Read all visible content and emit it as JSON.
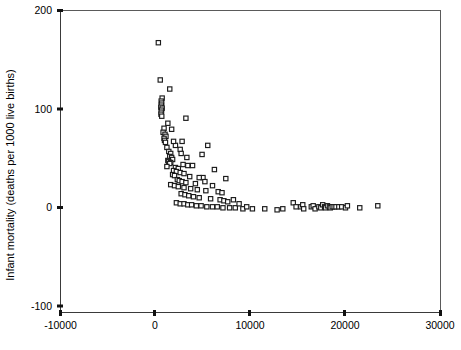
{
  "chart_data": {
    "type": "scatter",
    "title": "",
    "xlabel": "",
    "ylabel": "Infant mortality (deaths per 1000 live births)",
    "xlim": [
      -10000,
      30000
    ],
    "ylim": [
      -100,
      200
    ],
    "xticks": [
      -10000,
      0,
      10000,
      20000,
      30000
    ],
    "yticks": [
      -100,
      0,
      100,
      200
    ],
    "xtick_labels": [
      "-10000",
      "0",
      "10000",
      "20000",
      "30000"
    ],
    "ytick_labels": [
      "-100",
      "0",
      "100",
      "200"
    ],
    "grid": false,
    "legend": null,
    "marker": "open-square",
    "marker_color": "#1b1b1b",
    "series": [
      {
        "name": "Countries",
        "points": [
          [
            300,
            168
          ],
          [
            500,
            131
          ],
          [
            1500,
            122
          ],
          [
            700,
            113
          ],
          [
            600,
            110
          ],
          [
            650,
            108
          ],
          [
            620,
            106
          ],
          [
            560,
            104
          ],
          [
            700,
            103
          ],
          [
            640,
            101
          ],
          [
            600,
            99
          ],
          [
            580,
            97
          ],
          [
            660,
            95
          ],
          [
            3200,
            93
          ],
          [
            900,
            83
          ],
          [
            800,
            79
          ],
          [
            1000,
            77
          ],
          [
            1100,
            75
          ],
          [
            900,
            73
          ],
          [
            950,
            71
          ],
          [
            1050,
            69
          ],
          [
            5500,
            66
          ],
          [
            1200,
            64
          ],
          [
            2600,
            62
          ],
          [
            1400,
            60
          ],
          [
            1600,
            58
          ],
          [
            4900,
            57
          ],
          [
            1500,
            55
          ],
          [
            1700,
            54
          ],
          [
            1800,
            52
          ],
          [
            1300,
            51
          ],
          [
            1400,
            50
          ],
          [
            1600,
            49
          ],
          [
            1500,
            48
          ],
          [
            2900,
            47
          ],
          [
            3400,
            46
          ],
          [
            1200,
            45
          ],
          [
            2100,
            44
          ],
          [
            2400,
            43
          ],
          [
            6200,
            42
          ],
          [
            1900,
            41
          ],
          [
            2200,
            40
          ],
          [
            2600,
            39
          ],
          [
            3000,
            38
          ],
          [
            1800,
            37
          ],
          [
            2000,
            36
          ],
          [
            3600,
            35
          ],
          [
            5000,
            34
          ],
          [
            7400,
            33
          ],
          [
            2300,
            32
          ],
          [
            2500,
            31
          ],
          [
            2800,
            30
          ],
          [
            3200,
            29
          ],
          [
            4200,
            28
          ],
          [
            1600,
            27
          ],
          [
            2000,
            26
          ],
          [
            2400,
            25
          ],
          [
            3000,
            24
          ],
          [
            3700,
            23
          ],
          [
            4400,
            22
          ],
          [
            5300,
            21
          ],
          [
            6600,
            20
          ],
          [
            7000,
            19
          ],
          [
            2700,
            18
          ],
          [
            3100,
            17
          ],
          [
            3500,
            16
          ],
          [
            4000,
            15
          ],
          [
            4600,
            14
          ],
          [
            5800,
            13
          ],
          [
            6800,
            12
          ],
          [
            7200,
            11
          ],
          [
            7600,
            10
          ],
          [
            2200,
            9
          ],
          [
            2600,
            8
          ],
          [
            3000,
            8
          ],
          [
            3400,
            7
          ],
          [
            3800,
            7
          ],
          [
            4300,
            6
          ],
          [
            4800,
            6
          ],
          [
            5400,
            5
          ],
          [
            6000,
            5
          ],
          [
            6500,
            5
          ],
          [
            7100,
            4
          ],
          [
            7800,
            4
          ],
          [
            8400,
            4
          ],
          [
            9200,
            3
          ],
          [
            10200,
            3
          ],
          [
            11500,
            3
          ],
          [
            14500,
            9
          ],
          [
            14800,
            5
          ],
          [
            15300,
            5
          ],
          [
            15500,
            7
          ],
          [
            15600,
            3
          ],
          [
            16400,
            5
          ],
          [
            16600,
            6
          ],
          [
            16800,
            3
          ],
          [
            17200,
            5
          ],
          [
            17400,
            4
          ],
          [
            17600,
            7
          ],
          [
            17800,
            5
          ],
          [
            17900,
            4
          ],
          [
            18100,
            6
          ],
          [
            18300,
            5
          ],
          [
            18400,
            4
          ],
          [
            18600,
            5
          ],
          [
            18800,
            5
          ],
          [
            19000,
            5
          ],
          [
            19300,
            5
          ],
          [
            19600,
            5
          ],
          [
            20000,
            4
          ],
          [
            20200,
            6
          ],
          [
            21500,
            4
          ],
          [
            23400,
            6
          ],
          [
            12800,
            2
          ],
          [
            13400,
            3
          ],
          [
            9600,
            5
          ],
          [
            8800,
            8
          ],
          [
            8200,
            12
          ],
          [
            6000,
            26
          ],
          [
            5200,
            30
          ],
          [
            4600,
            34
          ],
          [
            3900,
            46
          ],
          [
            3300,
            54
          ],
          [
            2700,
            58
          ],
          [
            2100,
            66
          ],
          [
            1900,
            70
          ],
          [
            1700,
            82
          ],
          [
            1300,
            88
          ],
          [
            2800,
            70
          ]
        ]
      }
    ]
  },
  "axes": {
    "x_axis_name": "x-axis",
    "y_axis_name": "y-axis"
  }
}
